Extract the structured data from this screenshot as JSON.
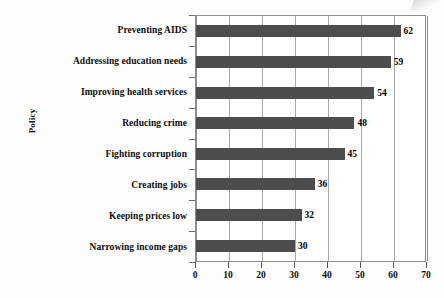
{
  "chart_data": {
    "type": "bar",
    "orientation": "horizontal",
    "title": "",
    "xlabel": "",
    "ylabel": "Policy",
    "categories": [
      "Preventing AIDS",
      "Addressing education needs",
      "Improving health services",
      "Reducing crime",
      "Fighting corruption",
      "Creating jobs",
      "Keeping prices low",
      "Narrowing income gaps"
    ],
    "values": [
      62,
      59,
      54,
      48,
      45,
      36,
      32,
      30
    ],
    "xlim": [
      0,
      70
    ],
    "xticks": [
      0,
      10,
      20,
      30,
      40,
      50,
      60,
      70
    ],
    "xtick_labels": [
      "0",
      "10",
      "20",
      "30",
      "40",
      "50",
      "60",
      "70"
    ],
    "grid": true,
    "grid_axis": "x",
    "legend": false,
    "data_labels": [
      "62",
      "59",
      "54",
      "48",
      "45",
      "36",
      "32",
      "30"
    ],
    "bar_color": "#4d4d4d",
    "plot_border_color": "#8d8d8d",
    "gridline_color": "#a9a9a9",
    "background_color": "#fdfdfd"
  }
}
